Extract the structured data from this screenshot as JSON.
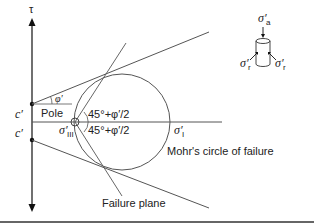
{
  "diagram": {
    "axis_label": "τ",
    "cohesion_upper": "c′",
    "cohesion_lower": "c′",
    "friction_angle": "φ′",
    "pole_label": "Pole",
    "angle_upper": "45°+φ′/2",
    "angle_lower": "45°+φ′/2",
    "sigma_minor": "σ′",
    "sigma_minor_sub": "III",
    "sigma_major": "σ′",
    "sigma_major_sub": "I",
    "mohr_circle_label": "Mohr's circle of failure",
    "failure_plane_label": "Failure plane",
    "inset": {
      "axial_stress": "σ′",
      "axial_sub": "a",
      "radial_stress_left": "σ′",
      "radial_sub_left": "r",
      "radial_stress_right": "σ′",
      "radial_sub_right": "r"
    }
  },
  "colors": {
    "line": "#555555",
    "axis": "#111111",
    "text": "#222222",
    "border": "#333333"
  }
}
